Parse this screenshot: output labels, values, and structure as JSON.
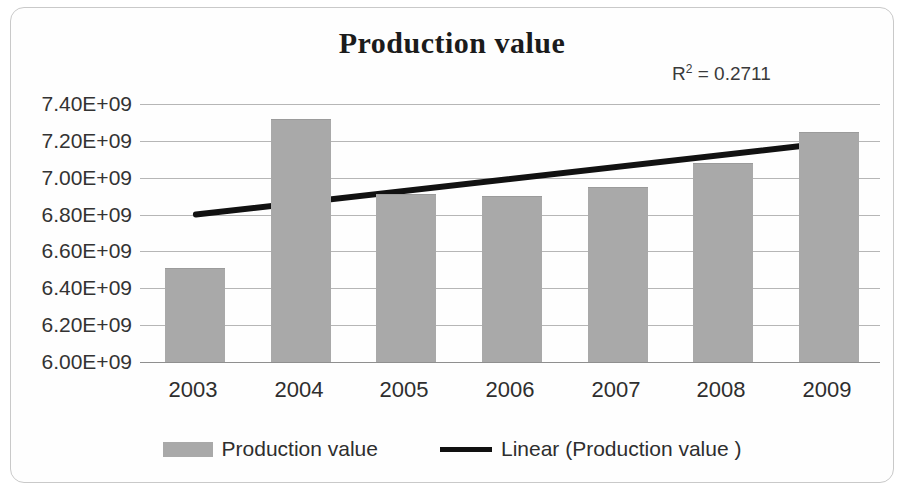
{
  "chart_data": {
    "type": "bar",
    "title": "Production value",
    "xlabel": "",
    "ylabel": "",
    "categories": [
      "2003",
      "2004",
      "2005",
      "2006",
      "2007",
      "2008",
      "2009"
    ],
    "series": [
      {
        "name": "Production value",
        "type": "bar",
        "values": [
          6510000000,
          7320000000,
          6910000000,
          6900000000,
          6950000000,
          7080000000,
          7250000000
        ]
      },
      {
        "name": "Linear (Production value )",
        "type": "trendline",
        "endpoints": [
          6800000000,
          7185000000
        ]
      }
    ],
    "ylim": [
      6000000000,
      7400000000
    ],
    "ytick_labels": [
      "7.40E+09",
      "7.20E+09",
      "7.00E+09",
      "6.80E+09",
      "6.60E+09",
      "6.40E+09",
      "6.20E+09",
      "6.00E+09"
    ],
    "ytick_values": [
      7400000000,
      7200000000,
      7000000000,
      6800000000,
      6600000000,
      6400000000,
      6200000000,
      6000000000
    ],
    "grid": true,
    "legend_position": "bottom",
    "annotations": [
      {
        "name": "r-squared",
        "text": "R² = 0.2711",
        "value": 0.2711
      }
    ],
    "colors": {
      "bar": "#a9a9a9",
      "trendline": "#111111",
      "gridline": "#b6b6b6",
      "text": "#2e2e2e",
      "frame": "#c9c9c9"
    }
  },
  "annotation": {
    "r_label": "R",
    "r_exponent": "2",
    "r_equals": " = 0.2711"
  },
  "legend": {
    "entries": [
      {
        "label": "Production value",
        "marker": "bar-swatch"
      },
      {
        "label": "Linear (Production value )",
        "marker": "line-swatch"
      }
    ]
  }
}
